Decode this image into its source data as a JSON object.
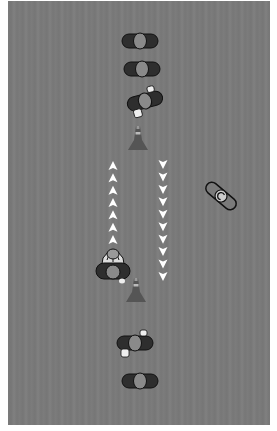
{
  "diagram": {
    "type": "sports-drill-top-down",
    "field_color": "#7a7a7a",
    "players": [
      {
        "id": "p1",
        "x": 140,
        "y": 41,
        "rot": 0,
        "style": "dark",
        "arms": false
      },
      {
        "id": "p2",
        "x": 142,
        "y": 69,
        "rot": 0,
        "style": "dark",
        "arms": false
      },
      {
        "id": "p3",
        "x": 145,
        "y": 101,
        "rot": -15,
        "style": "dark",
        "arms": true
      },
      {
        "id": "p4",
        "x": 221,
        "y": 196,
        "rot": 40,
        "style": "outline",
        "arms": false
      },
      {
        "id": "p5",
        "x": 113,
        "y": 270,
        "rot": 180,
        "style": "dark-detailed",
        "arms": true
      },
      {
        "id": "p6",
        "x": 135,
        "y": 343,
        "rot": 0,
        "style": "dark",
        "arms": true
      },
      {
        "id": "p7",
        "x": 140,
        "y": 381,
        "rot": 0,
        "style": "dark",
        "arms": false
      }
    ],
    "cones": [
      {
        "id": "cone-top",
        "x": 138,
        "y": 140
      },
      {
        "id": "cone-bottom",
        "x": 136,
        "y": 292
      }
    ],
    "arrows": [
      {
        "id": "arrow-up-lane",
        "x": 113,
        "y_start": 166,
        "y_end": 240,
        "direction": "up",
        "count": 7
      },
      {
        "id": "arrow-down-lane",
        "x": 163,
        "y_start": 164,
        "y_end": 276,
        "direction": "down",
        "count": 10
      }
    ],
    "colors": {
      "player_body": "#2e2e2e",
      "player_head": "#8a8a8a",
      "hands": "#eeeeee",
      "outline": "#111111",
      "cone": "#555555",
      "arrow": "#ffffff"
    }
  }
}
